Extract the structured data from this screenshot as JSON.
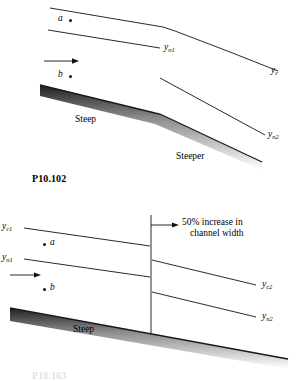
{
  "page": {
    "caption_main": "P10.102",
    "caption_bottom": "P10.103"
  },
  "figure1": {
    "name": "steep-to-steeper-channel-profile",
    "labels": {
      "point_a": "a",
      "point_b": "b",
      "y_n1": {
        "base": "y",
        "sub": "n1"
      },
      "y_c": {
        "base": "y",
        "sub": "c"
      },
      "y_n2": {
        "base": "y",
        "sub": "n2"
      },
      "slope_upstream": "Steep",
      "slope_downstream": "Steeper"
    },
    "flow_arrow": "flow-direction-arrow"
  },
  "figure2": {
    "name": "steep-channel-width-increase-profile",
    "labels": {
      "y_c1": {
        "base": "y",
        "sub": "c1"
      },
      "y_n1": {
        "base": "y",
        "sub": "n1"
      },
      "point_a": "a",
      "point_b": "b",
      "y_c2": {
        "base": "y",
        "sub": "c2"
      },
      "y_n2": {
        "base": "y",
        "sub": "n2"
      },
      "slope": "Steep",
      "annotation_line1": "50% increase in",
      "annotation_line2": "channel width"
    },
    "flow_arrow": "flow-direction-arrow",
    "transition_marker": "channel-width-transition-line"
  },
  "colors": {
    "ink": "#111111",
    "bed_dark": "#2b2b2b",
    "bed_light": "#ffffff",
    "background": "#ffffff"
  }
}
